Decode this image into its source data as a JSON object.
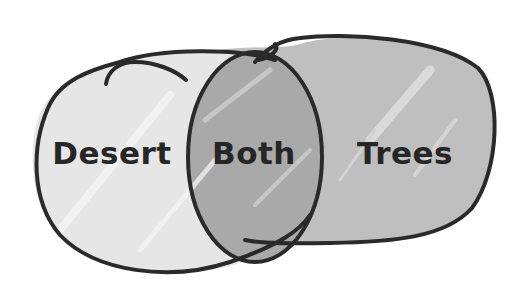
{
  "diagram": {
    "type": "venn",
    "sets": [
      {
        "id": "desert",
        "label": "Desert",
        "fill": "#e5e5e5"
      },
      {
        "id": "trees",
        "label": "Trees",
        "fill": "#bfbfbf"
      }
    ],
    "intersection": {
      "label": "Both",
      "fill": "#a9a9a9"
    },
    "outline_color": "#2a2a2a"
  },
  "labels": {
    "left": "Desert",
    "center": "Both",
    "right": "Trees"
  }
}
